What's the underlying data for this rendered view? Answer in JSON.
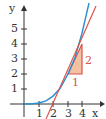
{
  "axes": {
    "x_label": "x",
    "y_label": "y",
    "x_ticks": [
      "1",
      "2",
      "3",
      "4"
    ],
    "y_ticks": [
      "1",
      "2",
      "3",
      "4",
      "5"
    ]
  },
  "triangle": {
    "run_label": "1",
    "rise_label": "2"
  },
  "colors": {
    "curve": "#2a8fd0",
    "tangent": "#d9534f",
    "triangle_fill": "#f4c2a0",
    "axis": "#333333"
  },
  "curve": {
    "function": "y = 2x^3/27"
  },
  "tangent": {
    "point": [
      3,
      2
    ],
    "slope": 2,
    "x_intercept": 2
  }
}
